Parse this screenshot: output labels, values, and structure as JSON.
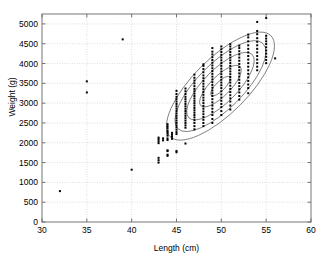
{
  "chart_data": {
    "type": "scatter",
    "title": "",
    "xlabel": "Length (cm)",
    "ylabel": "Weight (g)",
    "xlim": [
      30,
      60
    ],
    "ylim": [
      0,
      5250
    ],
    "xticks": [
      30,
      35,
      40,
      45,
      50,
      55,
      60
    ],
    "yticks": [
      0,
      500,
      1000,
      1500,
      2000,
      2500,
      3000,
      3500,
      4000,
      4500,
      5000
    ],
    "xticklabels": [
      "30",
      "35",
      "40",
      "45",
      "50",
      "55",
      "60"
    ],
    "yticklabels": [
      "0",
      "500",
      "1000",
      "1500",
      "2000",
      "2500",
      "3000",
      "3500",
      "4000",
      "4500",
      "5000"
    ],
    "grid": true,
    "grid_style": "dotted",
    "grid_color": "#b9b9b9",
    "legend": null,
    "marker": "square",
    "marker_size": 2,
    "marker_color": "#000000",
    "ellipse_color": "#555555",
    "axis_color": "#666666",
    "background": "#ffffff",
    "outliers": [
      {
        "x": 32,
        "y": 780
      },
      {
        "x": 35,
        "y": 3270
      },
      {
        "x": 35,
        "y": 3550
      },
      {
        "x": 39,
        "y": 4610
      },
      {
        "x": 40,
        "y": 1320
      }
    ],
    "columns": [
      {
        "x": 43,
        "values": [
          1500,
          1560,
          1620,
          1990,
          2040,
          2090,
          2130
        ]
      },
      {
        "x": 43.5,
        "values": [
          2060,
          2110
        ]
      },
      {
        "x": 44,
        "values": [
          1670,
          1700,
          1790,
          1810,
          2070,
          2110,
          2180,
          2230,
          2270,
          2310,
          2370,
          2420,
          2470
        ]
      },
      {
        "x": 44.5,
        "values": [
          2100,
          2150,
          2200,
          2250
        ]
      },
      {
        "x": 45,
        "values": [
          1760,
          1790,
          2220,
          2270,
          2330,
          2390,
          2440,
          2500,
          2560,
          2620,
          2680,
          2740,
          2800,
          2860,
          2920,
          2980,
          3040,
          3100,
          3160,
          3230,
          3310
        ]
      },
      {
        "x": 46,
        "values": [
          1980,
          2380,
          2440,
          2500,
          2560,
          2620,
          2680,
          2740,
          2800,
          2860,
          2920,
          2980,
          3040,
          3100,
          3160,
          3230,
          3300,
          3370
        ]
      },
      {
        "x": 47,
        "values": [
          2340,
          2420,
          2500,
          2570,
          2640,
          2700,
          2760,
          2820,
          2880,
          2940,
          3000,
          3060,
          3120,
          3180,
          3240,
          3300,
          3360,
          3430,
          3500,
          3570,
          3640,
          3720
        ]
      },
      {
        "x": 48,
        "values": [
          2420,
          2500,
          2580,
          2650,
          2720,
          2790,
          2860,
          2930,
          3000,
          3070,
          3140,
          3210,
          3280,
          3350,
          3420,
          3490,
          3560,
          3630,
          3700,
          3780,
          3860,
          3940,
          3980
        ]
      },
      {
        "x": 49,
        "values": [
          2500,
          2600,
          2700,
          2780,
          2860,
          2940,
          3020,
          3100,
          3180,
          3250,
          3320,
          3390,
          3460,
          3530,
          3600,
          3670,
          3740,
          3810,
          3880,
          3950,
          4020,
          4090,
          4160,
          4230,
          4300,
          4390
        ]
      },
      {
        "x": 50,
        "values": [
          2700,
          2800,
          2900,
          2980,
          3060,
          3140,
          3220,
          3300,
          3380,
          3450,
          3520,
          3590,
          3660,
          3730,
          3800,
          3870,
          3940,
          4010,
          4080,
          4150,
          4220,
          4290,
          4360,
          4430
        ]
      },
      {
        "x": 51,
        "values": [
          2840,
          2940,
          3040,
          3120,
          3200,
          3280,
          3360,
          3440,
          3520,
          3590,
          3660,
          3730,
          3800,
          3870,
          3940,
          4010,
          4080,
          4150,
          4220,
          4290,
          4360,
          4430,
          4490
        ]
      },
      {
        "x": 52,
        "values": [
          3090,
          3180,
          3270,
          3350,
          3430,
          3510,
          3590,
          3670,
          3750,
          3830,
          3910,
          3990,
          4070,
          4150,
          4230,
          4310,
          4390,
          4450
        ]
      },
      {
        "x": 53,
        "values": [
          3250,
          3380,
          3470,
          3560,
          3650,
          3740,
          3830,
          3920,
          4010,
          4100,
          4190,
          4280,
          4370,
          4460,
          4560,
          4660,
          4730
        ]
      },
      {
        "x": 54,
        "values": [
          3830,
          3920,
          4010,
          4100,
          4190,
          4280,
          4370,
          4460,
          4550,
          4640,
          4740,
          4820,
          5050
        ]
      },
      {
        "x": 55,
        "values": [
          4010,
          4090,
          4170,
          4250,
          4330,
          4410,
          4490,
          4560,
          4630,
          4700,
          5150
        ]
      },
      {
        "x": 56,
        "values": [
          4130
        ]
      }
    ],
    "ellipses": [
      {
        "cx": 49.9,
        "cy": 3430,
        "rx": 1800,
        "ry": 690,
        "angle": 45,
        "level": "outer"
      },
      {
        "cx": 49.9,
        "cy": 3430,
        "rx": 1520,
        "ry": 570,
        "angle": 45,
        "level": "second"
      },
      {
        "cx": 49.9,
        "cy": 3430,
        "rx": 1130,
        "ry": 420,
        "angle": 45,
        "level": "third"
      },
      {
        "cx": 49.9,
        "cy": 3430,
        "rx": 700,
        "ry": 250,
        "angle": 45,
        "level": "inner"
      },
      {
        "cx": 49.9,
        "cy": 3430,
        "rx": 330,
        "ry": 115,
        "angle": 45,
        "level": "core"
      }
    ]
  }
}
